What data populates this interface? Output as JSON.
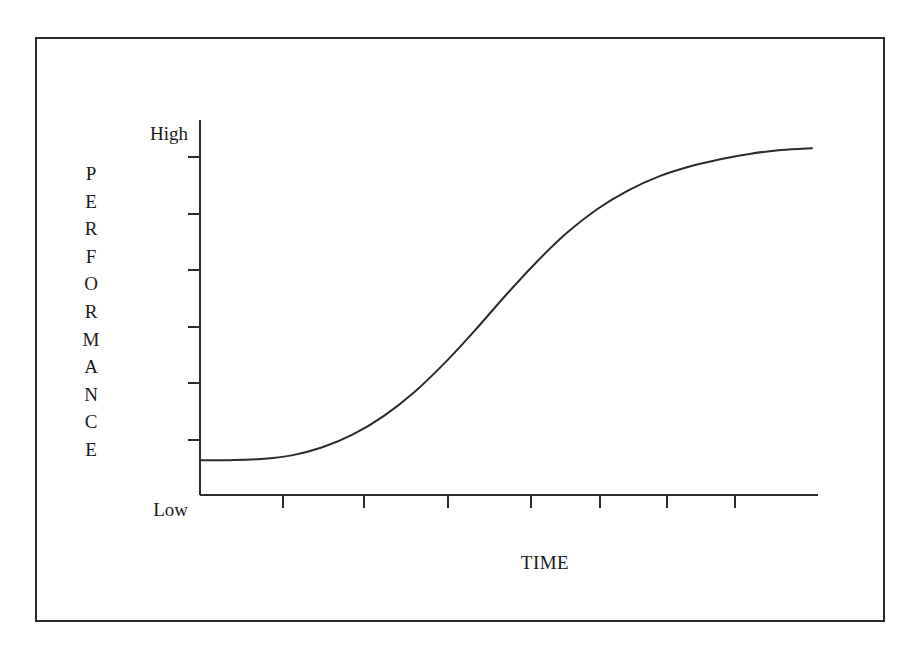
{
  "figure": {
    "frame_color": "#2b2b2b",
    "background": "#ffffff",
    "line_color": "#2b2b2b"
  },
  "axes": {
    "y_title_text": "PERFORMANCE",
    "y_title_letters": [
      "P",
      "E",
      "R",
      "F",
      "O",
      "R",
      "M",
      "A",
      "N",
      "C",
      "E"
    ],
    "y_label_high": "High",
    "y_label_low": "Low",
    "x_title": "TIME"
  },
  "chart_data": {
    "type": "line",
    "title": "",
    "xlabel": "TIME",
    "ylabel": "PERFORMANCE",
    "subtitle": "",
    "grid": false,
    "legend": false,
    "annotations": [],
    "xlim": [
      0,
      10
    ],
    "ylim": [
      0,
      10
    ],
    "x_tick_labels": [],
    "y_tick_labels": [
      "Low",
      "High"
    ],
    "x_tick_count": 7,
    "y_tick_count": 6,
    "series": [
      {
        "name": "performance",
        "x": [
          0.0,
          0.5,
          1.0,
          1.5,
          2.0,
          2.5,
          3.0,
          3.5,
          4.0,
          4.5,
          5.0,
          5.5,
          6.0,
          6.5,
          7.0,
          7.5,
          8.0,
          8.5,
          9.0,
          9.5,
          10.0
        ],
        "y": [
          0.95,
          0.95,
          0.98,
          1.08,
          1.3,
          1.65,
          2.15,
          2.8,
          3.6,
          4.5,
          5.45,
          6.35,
          7.15,
          7.8,
          8.3,
          8.68,
          8.95,
          9.15,
          9.3,
          9.4,
          9.45
        ]
      }
    ]
  }
}
